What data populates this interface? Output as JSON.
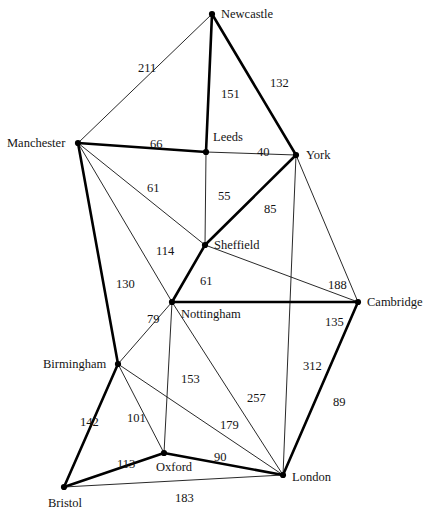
{
  "figure": {
    "background_color": "#ffffff",
    "node_color": "#000000",
    "edge_color": "#111111",
    "label_color": "#141414",
    "width": 432,
    "height": 514
  },
  "chart_data": {
    "type": "diagram",
    "graph_type": "weighted undirected graph",
    "units": "miles",
    "nodes": [
      {
        "id": "newcastle",
        "label": "Newcastle",
        "x": 212,
        "y": 14,
        "label_dx": 9,
        "label_dy": -6
      },
      {
        "id": "manchester",
        "label": "Manchester",
        "x": 78,
        "y": 143,
        "label_dx": -71,
        "label_dy": -6
      },
      {
        "id": "leeds",
        "label": "Leeds",
        "x": 206,
        "y": 152,
        "label_dx": 7,
        "label_dy": -21
      },
      {
        "id": "york",
        "label": "York",
        "x": 296,
        "y": 155,
        "label_dx": 10,
        "label_dy": -6
      },
      {
        "id": "sheffield",
        "label": "Sheffield",
        "x": 205,
        "y": 245,
        "label_dx": 9,
        "label_dy": -6
      },
      {
        "id": "nottingham",
        "label": "Nottingham",
        "x": 172,
        "y": 302,
        "label_dx": 9,
        "label_dy": 6
      },
      {
        "id": "cambridge",
        "label": "Cambridge",
        "x": 358,
        "y": 302,
        "label_dx": 9,
        "label_dy": -6
      },
      {
        "id": "birmingham",
        "label": "Birmingham",
        "x": 118,
        "y": 364,
        "label_dx": -75,
        "label_dy": -6
      },
      {
        "id": "oxford",
        "label": "Oxford",
        "x": 164,
        "y": 453,
        "label_dx": -8,
        "label_dy": 8
      },
      {
        "id": "london",
        "label": "London",
        "x": 283,
        "y": 475,
        "label_dx": 9,
        "label_dy": -4
      },
      {
        "id": "bristol",
        "label": "Bristol",
        "x": 64,
        "y": 487,
        "label_dx": -16,
        "label_dy": 10
      }
    ],
    "edges": [
      {
        "from": "newcastle",
        "to": "manchester",
        "weight": 211,
        "style": "thin",
        "label_x": 138,
        "label_y": 62
      },
      {
        "from": "newcastle",
        "to": "leeds",
        "weight": 151,
        "style": "thick",
        "label_x": 221,
        "label_y": 88
      },
      {
        "from": "newcastle",
        "to": "york",
        "weight": 132,
        "style": "thick",
        "label_x": 270,
        "label_y": 77
      },
      {
        "from": "manchester",
        "to": "leeds",
        "weight": 66,
        "style": "thick",
        "label_x": 150,
        "label_y": 138
      },
      {
        "from": "manchester",
        "to": "sheffield",
        "weight": 61,
        "style": "thin",
        "label_x": 147,
        "label_y": 182
      },
      {
        "from": "manchester",
        "to": "nottingham",
        "weight": 114,
        "style": "thin",
        "label_x": 156,
        "label_y": 245
      },
      {
        "from": "manchester",
        "to": "birmingham",
        "weight": 130,
        "style": "thick",
        "label_x": 116,
        "label_y": 278
      },
      {
        "from": "leeds",
        "to": "york",
        "weight": 40,
        "style": "thin",
        "label_x": 257,
        "label_y": 146
      },
      {
        "from": "leeds",
        "to": "sheffield",
        "weight": 55,
        "style": "thin",
        "label_x": 218,
        "label_y": 190
      },
      {
        "from": "york",
        "to": "sheffield",
        "weight": 85,
        "style": "thick",
        "label_x": 264,
        "label_y": 203
      },
      {
        "from": "york",
        "to": "cambridge",
        "weight": 188,
        "style": "thin",
        "label_x": 328,
        "label_y": 279
      },
      {
        "from": "york",
        "to": "london",
        "weight": 312,
        "style": "thin",
        "label_x": 303,
        "label_y": 360
      },
      {
        "from": "sheffield",
        "to": "nottingham",
        "weight": 61,
        "style": "thick",
        "label_x": 200,
        "label_y": 275
      },
      {
        "from": "sheffield",
        "to": "cambridge",
        "weight": 188,
        "style": "thin",
        "label_x": null,
        "label_y": null
      },
      {
        "from": "nottingham",
        "to": "birmingham",
        "weight": 79,
        "style": "thin",
        "label_x": 147,
        "label_y": 313
      },
      {
        "from": "nottingham",
        "to": "cambridge",
        "weight": 135,
        "style": "thick",
        "label_x": 325,
        "label_y": 316
      },
      {
        "from": "nottingham",
        "to": "oxford",
        "weight": 153,
        "style": "thin",
        "label_x": 181,
        "label_y": 373
      },
      {
        "from": "nottingham",
        "to": "london",
        "weight": 257,
        "style": "thin",
        "label_x": 247,
        "label_y": 392
      },
      {
        "from": "birmingham",
        "to": "oxford",
        "weight": 101,
        "style": "thin",
        "label_x": 127,
        "label_y": 412
      },
      {
        "from": "birmingham",
        "to": "bristol",
        "weight": 142,
        "style": "thick",
        "label_x": 80,
        "label_y": 416
      },
      {
        "from": "birmingham",
        "to": "london",
        "weight": 179,
        "style": "thin",
        "label_x": 220,
        "label_y": 419
      },
      {
        "from": "cambridge",
        "to": "london",
        "weight": 89,
        "style": "thick",
        "label_x": 333,
        "label_y": 396
      },
      {
        "from": "oxford",
        "to": "london",
        "weight": 90,
        "style": "thick",
        "label_x": 214,
        "label_y": 451
      },
      {
        "from": "oxford",
        "to": "bristol",
        "weight": 113,
        "style": "thick",
        "label_x": 117,
        "label_y": 458
      },
      {
        "from": "bristol",
        "to": "london",
        "weight": 183,
        "style": "thin",
        "label_x": 175,
        "label_y": 492
      }
    ]
  }
}
